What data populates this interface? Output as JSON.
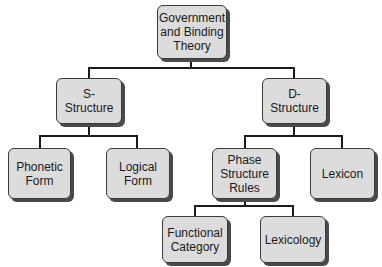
{
  "diagram": {
    "type": "tree",
    "root": {
      "label": "Government and Binding Theory",
      "lines": [
        "Government",
        "and Binding",
        "Theory"
      ]
    },
    "nodes": {
      "s_structure": {
        "label": "S-Structure",
        "lines": [
          "S-Structure"
        ]
      },
      "d_structure": {
        "label": "D-Structure",
        "lines": [
          "D-Structure"
        ]
      },
      "phonetic_form": {
        "label": "Phonetic Form",
        "lines": [
          "Phonetic",
          "Form"
        ]
      },
      "logical_form": {
        "label": "Logical Form",
        "lines": [
          "Logical",
          "Form"
        ]
      },
      "phase_structure_rules": {
        "label": "Phase Structure Rules",
        "lines": [
          "Phase",
          "Structure",
          "Rules"
        ]
      },
      "lexicon": {
        "label": "Lexicon",
        "lines": [
          "Lexicon"
        ]
      },
      "functional_category": {
        "label": "Functional Category",
        "lines": [
          "Functional",
          "Category"
        ]
      },
      "lexicology": {
        "label": "Lexicology",
        "lines": [
          "Lexicology"
        ]
      }
    },
    "edges": [
      [
        "Government and Binding Theory",
        "S-Structure"
      ],
      [
        "Government and Binding Theory",
        "D-Structure"
      ],
      [
        "S-Structure",
        "Phonetic Form"
      ],
      [
        "S-Structure",
        "Logical Form"
      ],
      [
        "D-Structure",
        "Phase Structure Rules"
      ],
      [
        "D-Structure",
        "Lexicon"
      ],
      [
        "Phase Structure Rules",
        "Functional Category"
      ],
      [
        "Phase Structure Rules",
        "Lexicology"
      ]
    ],
    "colors": {
      "node_fill": "#dcdcdc",
      "node_border": "#3a3a3a",
      "shadow": "#4a4a4a",
      "connector": "#1a1a1a"
    }
  }
}
